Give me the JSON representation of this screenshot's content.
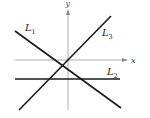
{
  "diagram": {
    "type": "coordinate-plane-lines",
    "axes": {
      "x_label": "x",
      "y_label": "y",
      "x_axis": {
        "x1": 15,
        "x2": 127,
        "y": 60
      },
      "y_axis": {
        "x": 68,
        "y1": 110,
        "y2": 10
      }
    },
    "lines": [
      {
        "id": "L1",
        "label_main": "L",
        "label_sub": "1",
        "x1": 15,
        "y1": 31,
        "x2": 121,
        "y2": 108,
        "label_x": 25,
        "label_y": 31,
        "description": "negative slope"
      },
      {
        "id": "L2",
        "label_main": "L",
        "label_sub": "2",
        "x1": 15,
        "y1": 79,
        "x2": 120,
        "y2": 79,
        "label_x": 107,
        "label_y": 75,
        "description": "horizontal, zero slope, below x-axis"
      },
      {
        "id": "L3",
        "label_main": "L",
        "label_sub": "3",
        "x1": 19,
        "y1": 110,
        "x2": 111,
        "y2": 16,
        "label_x": 102,
        "label_y": 36,
        "description": "positive slope"
      }
    ],
    "colors": {
      "lines": "#1a1a1a",
      "axes": "#9a9a9a",
      "background": "#ffffff"
    }
  }
}
